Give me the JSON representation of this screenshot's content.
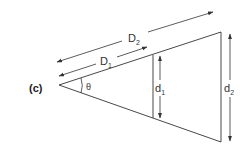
{
  "panel_label": "(c)",
  "labels": {
    "theta": "θ",
    "D1_main": "D",
    "D1_sub": "1",
    "D2_main": "D",
    "D2_sub": "2",
    "d1_main": "d",
    "d1_sub": "1",
    "d2_main": "d",
    "d2_sub": "2"
  },
  "colors": {
    "stroke": "#333333",
    "background": "#ffffff"
  }
}
